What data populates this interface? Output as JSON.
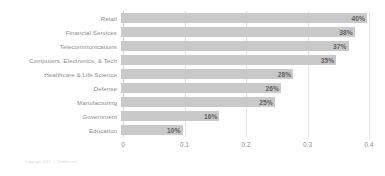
{
  "chart_data": {
    "type": "bar",
    "orientation": "horizontal",
    "title": "",
    "subtitle": "",
    "xlabel": "",
    "ylabel": "",
    "xlim": [
      0,
      0.4
    ],
    "xticks": [
      "0",
      "0.1",
      "0.2",
      "0.3",
      "0.4"
    ],
    "xtick_values": [
      0,
      0.1,
      0.2,
      0.3,
      0.4
    ],
    "grid": true,
    "legend": false,
    "bar_color": "#c9c9c9",
    "label_color": "#8d8d8d",
    "value_color": "#5f5f5f",
    "categories": [
      "Retail",
      "Financial Services",
      "Telecommunications",
      "Computers, Electronics, & Tech",
      "Healthcare & Life Science",
      "Defense",
      "Manufacturing",
      "Government",
      "Education"
    ],
    "values": [
      0.4,
      0.38,
      0.37,
      0.35,
      0.28,
      0.26,
      0.25,
      0.16,
      0.1
    ],
    "data_labels": [
      "40%",
      "38%",
      "37%",
      "35%",
      "28%",
      "26%",
      "25%",
      "16%",
      "10%"
    ]
  },
  "footer": {
    "note": "Copyright 2015 — Confidential"
  }
}
